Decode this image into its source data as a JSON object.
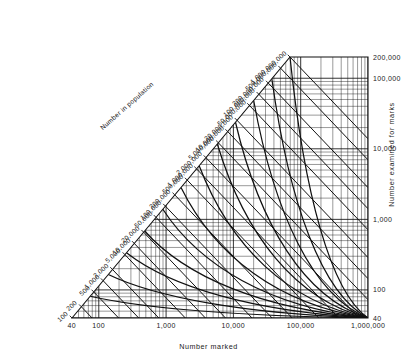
{
  "figure": {
    "width": 417,
    "height": 355,
    "background": "#ffffff",
    "line_color": "#111111"
  },
  "chart_data": {
    "type": "line",
    "title": "",
    "subtitle": "",
    "xlabel": "Number marked",
    "ylabel": "Number examined for marks",
    "diagonal_label": "Number in population",
    "xscale": "log",
    "yscale": "log",
    "diagonal_scale": "log",
    "xlim": [
      40,
      1000000
    ],
    "ylim": [
      40,
      200000
    ],
    "diagonal_lim": [
      100,
      1000000000
    ],
    "grid": true,
    "legend": false,
    "legend_position": "none",
    "x_ticks": [
      {
        "value": 40,
        "label": "40"
      },
      {
        "value": 100,
        "label": "100"
      },
      {
        "value": 1000,
        "label": "1,000"
      },
      {
        "value": 10000,
        "label": "10,000"
      },
      {
        "value": 100000,
        "label": "100,000"
      },
      {
        "value": 1000000,
        "label": "1,000,000"
      }
    ],
    "y_ticks": [
      {
        "value": 40,
        "label": "40"
      },
      {
        "value": 100,
        "label": "100"
      },
      {
        "value": 1000,
        "label": "1,000"
      },
      {
        "value": 10000,
        "label": "10,000"
      },
      {
        "value": 100000,
        "label": "100,000"
      },
      {
        "value": 200000,
        "label": "200,000"
      }
    ],
    "diagonal_ticks": [
      {
        "value": 100,
        "label": "100"
      },
      {
        "value": 200,
        "label": "200"
      },
      {
        "value": 500,
        "label": "500"
      },
      {
        "value": 1000,
        "label": "1,000"
      },
      {
        "value": 2000,
        "label": "2,000"
      },
      {
        "value": 5000,
        "label": "5,000"
      },
      {
        "value": 10000,
        "label": "10,000"
      },
      {
        "value": 20000,
        "label": "20,000"
      },
      {
        "value": 50000,
        "label": "50,000"
      },
      {
        "value": 100000,
        "label": "100,000"
      },
      {
        "value": 200000,
        "label": "200,000"
      },
      {
        "value": 500000,
        "label": "500,000"
      },
      {
        "value": 1000000,
        "label": "1,000,000"
      },
      {
        "value": 2000000,
        "label": "2,000,000"
      },
      {
        "value": 5000000,
        "label": "5,000,000"
      },
      {
        "value": 10000000,
        "label": "10,000,000"
      },
      {
        "value": 20000000,
        "label": "20,000,000"
      },
      {
        "value": 50000000,
        "label": "50,000,000"
      },
      {
        "value": 100000000,
        "label": "100,000,000"
      },
      {
        "value": 200000000,
        "label": "200,000,000"
      },
      {
        "value": 500000000,
        "label": "500,000,000"
      },
      {
        "value": 1000000000,
        "label": "1,000,000,000"
      }
    ],
    "series": [
      {
        "name": "population-isolines",
        "kind": "isoline-hyperbola",
        "relation": "marked * examined / recaptured = population",
        "values": [
          100,
          200,
          500,
          1000,
          2000,
          5000,
          10000,
          20000,
          50000,
          100000,
          200000,
          500000,
          1000000,
          2000000,
          5000000,
          10000000,
          20000000,
          50000000,
          100000000,
          200000000,
          500000000,
          1000000000
        ]
      },
      {
        "name": "recapture-curves",
        "kind": "curve",
        "note": "Curved family crossing the grid from upper-left to lower-right.",
        "values": [
          1,
          2,
          5,
          10,
          20,
          50,
          100,
          200,
          500,
          1000,
          2000,
          5000,
          10000
        ]
      }
    ],
    "minor_grid_multipliers": [
      2,
      3,
      4,
      5,
      6,
      7,
      8,
      9
    ]
  }
}
